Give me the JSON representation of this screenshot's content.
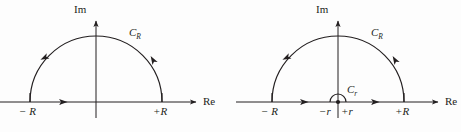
{
  "figure": {
    "background_color": "#fdfdfd",
    "stroke_color": "#231f20",
    "panels": [
      {
        "id": "left-panel",
        "name": "semicircular-contour",
        "axis_labels": {
          "imaginary": "Im",
          "real": "Re"
        },
        "point_labels": {
          "left_endpoint": "− R",
          "right_endpoint": "+R"
        },
        "curve_label": "C",
        "curve_subscript": "R",
        "geometry": {
          "origin_x": 96,
          "baseline_y": 102,
          "big_radius": 66,
          "im_axis_top_y": 18,
          "re_axis_right_x": 200
        }
      },
      {
        "id": "right-panel",
        "name": "indented-semicircular-contour",
        "axis_labels": {
          "imaginary": "Im",
          "real": "Re"
        },
        "point_labels": {
          "left_endpoint": "− R",
          "inner_left": "−r",
          "inner_right": "+r",
          "right_endpoint": "+R"
        },
        "curve_label_outer": "C",
        "curve_subscript_outer": "R",
        "curve_label_inner": "C",
        "curve_subscript_inner": "r",
        "geometry": {
          "origin_x": 338,
          "baseline_y": 102,
          "big_radius": 66,
          "small_radius": 8,
          "im_axis_top_y": 18,
          "re_axis_right_x": 442
        }
      }
    ]
  }
}
